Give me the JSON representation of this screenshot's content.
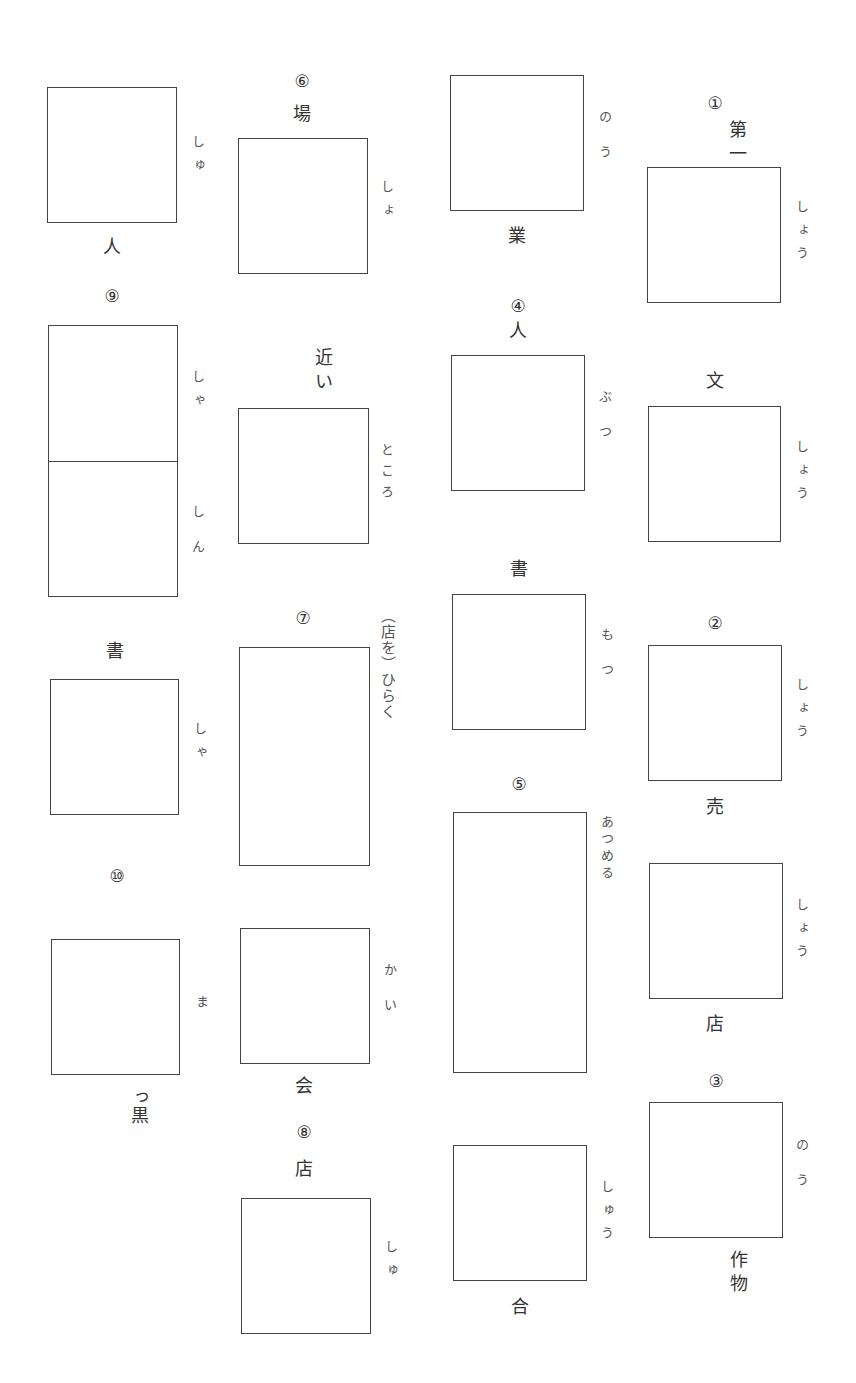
{
  "worksheet": {
    "items": [
      {
        "id": "q1",
        "number": "①",
        "before": "第一",
        "reading": "しょう",
        "after": ""
      },
      {
        "id": "q1b",
        "number": "",
        "before": "文",
        "reading": "しょう",
        "after": ""
      },
      {
        "id": "q2",
        "number": "②",
        "before": "",
        "reading": "しょう",
        "after": "売"
      },
      {
        "id": "q2b",
        "number": "",
        "before": "",
        "reading": "しょう",
        "after": "店"
      },
      {
        "id": "q3",
        "number": "③",
        "before": "",
        "reading": "のう",
        "after": "作物"
      },
      {
        "id": "q3a",
        "number": "",
        "before": "",
        "reading": "のう",
        "after": "業"
      },
      {
        "id": "q4",
        "number": "④",
        "before": "人",
        "reading": "ぶつ",
        "after": ""
      },
      {
        "id": "q4b",
        "number": "",
        "before": "書",
        "reading": "もつ",
        "after": ""
      },
      {
        "id": "q5",
        "number": "⑤",
        "before": "",
        "reading": "あつめる",
        "after": ""
      },
      {
        "id": "q5b",
        "number": "",
        "before": "",
        "reading": "しゅう",
        "after": "合"
      },
      {
        "id": "q6",
        "number": "⑥",
        "before": "場",
        "reading": "しょ",
        "after": ""
      },
      {
        "id": "q6b",
        "number": "",
        "before": "近い",
        "reading": "ところ",
        "after": ""
      },
      {
        "id": "q7",
        "number": "⑦",
        "before": "",
        "reading": "（店を）ひらく",
        "after": ""
      },
      {
        "id": "q7b",
        "number": "",
        "before": "",
        "reading": "かい",
        "after": "会"
      },
      {
        "id": "q8",
        "number": "⑧",
        "before": "店",
        "reading": "しゅ",
        "after": ""
      },
      {
        "id": "q8a",
        "number": "",
        "before": "",
        "reading": "しゅ",
        "after": "人"
      },
      {
        "id": "q9",
        "number": "⑨",
        "before": "",
        "reading": "しゃしん",
        "after": ""
      },
      {
        "id": "q9b",
        "number": "",
        "before": "書",
        "reading": "しゃ",
        "after": ""
      },
      {
        "id": "q10",
        "number": "⑩",
        "before": "",
        "reading": "ま",
        "after": "っ黒"
      }
    ]
  }
}
